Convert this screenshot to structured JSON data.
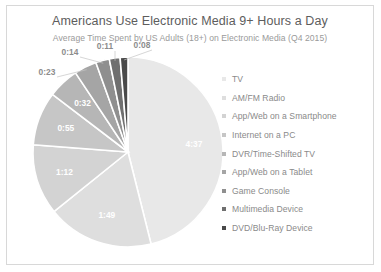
{
  "chart": {
    "title": "Americans Use Electronic Media 9+ Hours a Day",
    "subtitle": "Average Time Spent by US Adults (18+) on Electronic Media (Q4 2015)"
  },
  "legend": {
    "items": [
      {
        "label": "TV",
        "color": "#e8e8e8"
      },
      {
        "label": "AM/FM Radio",
        "color": "#dedede"
      },
      {
        "label": "App/Web on a Smartphone",
        "color": "#d3d3d3"
      },
      {
        "label": "Internet on a PC",
        "color": "#c6c6c6"
      },
      {
        "label": "DVR/Time-Shifted TV",
        "color": "#b6b6b6"
      },
      {
        "label": "App/Web on a Tablet",
        "color": "#a5a5a5"
      },
      {
        "label": "Game Console",
        "color": "#8f8f8f"
      },
      {
        "label": "Multimedia Device",
        "color": "#6f6f6f"
      },
      {
        "label": "DVD/Blu-Ray Device",
        "color": "#4a4a4a"
      }
    ]
  },
  "chart_data": {
    "type": "pie",
    "title": "Americans Use Electronic Media 9+ Hours a Day",
    "subtitle": "Average Time Spent by US Adults (18+) on Electronic Media (Q4 2015)",
    "unit": "hours:minutes per day",
    "legend_position": "right",
    "categories": [
      "TV",
      "AM/FM Radio",
      "App/Web on a Smartphone",
      "Internet on a PC",
      "DVR/Time-Shifted TV",
      "App/Web on a Tablet",
      "Game Console",
      "Multimedia Device",
      "DVD/Blu-Ray Device"
    ],
    "labels": [
      "4:37",
      "1:49",
      "1:12",
      "0:55",
      "0:32",
      "0:23",
      "0:14",
      "0:11",
      "0:08"
    ],
    "values_minutes": [
      277,
      109,
      72,
      55,
      32,
      23,
      14,
      11,
      8
    ],
    "total_minutes": 601,
    "colors": [
      "#e8e8e8",
      "#dedede",
      "#d3d3d3",
      "#c6c6c6",
      "#b6b6b6",
      "#a5a5a5",
      "#8f8f8f",
      "#6f6f6f",
      "#4a4a4a"
    ],
    "label_placement": [
      "inside",
      "inside",
      "inside",
      "inside",
      "inside",
      "outside",
      "outside",
      "outside",
      "outside"
    ]
  }
}
